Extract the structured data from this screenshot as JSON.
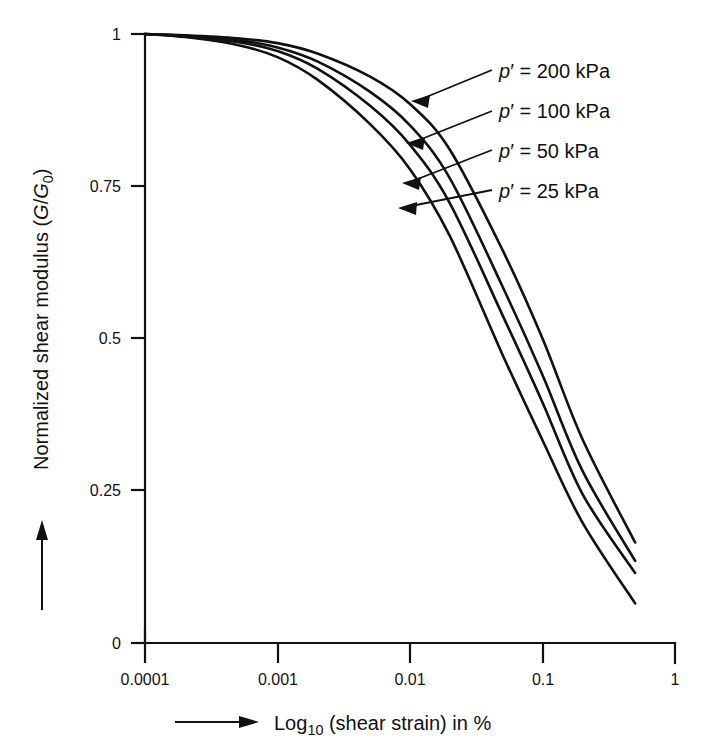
{
  "chart_data": {
    "type": "line",
    "title": "",
    "xlabel": "Log10 (shear strain) in %",
    "ylabel": "Normalized shear modulus (G/G0)",
    "xscale": "log",
    "xlim": [
      0.0001,
      1
    ],
    "ylim": [
      0,
      1
    ],
    "grid": false,
    "legend_position": "in-plot-right-with-arrows",
    "x_tick_labels": [
      "0.0001",
      "0.001",
      "0.01",
      "0.1",
      "1"
    ],
    "x_tick_values": [
      0.0001,
      0.001,
      0.01,
      0.1,
      1
    ],
    "y_tick_labels": [
      "0",
      "0.25",
      "0.5",
      "0.75",
      "1"
    ],
    "y_tick_values": [
      0,
      0.25,
      0.5,
      0.75,
      1
    ],
    "x": [
      0.0001,
      0.0002,
      0.0005,
      0.001,
      0.002,
      0.005,
      0.01,
      0.02,
      0.05,
      0.1,
      0.2,
      0.5
    ],
    "series": [
      {
        "name": "p' = 200 kPa",
        "pressure_kpa": 200,
        "values": [
          1.0,
          0.998,
          0.993,
          0.985,
          0.968,
          0.93,
          0.885,
          0.81,
          0.645,
          0.5,
          0.335,
          0.165
        ]
      },
      {
        "name": "p' = 100 kPa",
        "pressure_kpa": 100,
        "values": [
          1.0,
          0.997,
          0.99,
          0.978,
          0.955,
          0.905,
          0.85,
          0.763,
          0.585,
          0.44,
          0.283,
          0.135
        ]
      },
      {
        "name": "p' = 50 kPa",
        "pressure_kpa": 50,
        "values": [
          1.0,
          0.996,
          0.987,
          0.972,
          0.943,
          0.882,
          0.818,
          0.722,
          0.538,
          0.395,
          0.245,
          0.115
        ]
      },
      {
        "name": "p' = 25 kPa",
        "pressure_kpa": 25,
        "values": [
          1.0,
          0.995,
          0.982,
          0.962,
          0.925,
          0.852,
          0.778,
          0.668,
          0.473,
          0.333,
          0.198,
          0.065
        ]
      }
    ]
  },
  "axes": {
    "y_title_prefix": "Normalized shear modulus (",
    "y_title_symbol_g": "G",
    "y_title_slash": "/",
    "y_title_symbol_g0": "G",
    "y_title_sub0": "0",
    "y_title_suffix": ")",
    "x_title_log": "Log",
    "x_title_sub10": "10",
    "x_title_rest": " (shear strain) in %"
  },
  "annotations": {
    "labels": [
      {
        "p": "p",
        "prime": "′",
        "eq": " = ",
        "value": "200 kPa",
        "full": "p′ = 200 kPa"
      },
      {
        "p": "p",
        "prime": "′",
        "eq": " = ",
        "value": "100 kPa",
        "full": "p′ = 100 kPa"
      },
      {
        "p": "p",
        "prime": "′",
        "eq": " = ",
        "value": "50 kPa",
        "full": "p′ = 50 kPa"
      },
      {
        "p": "p",
        "prime": "′",
        "eq": " = ",
        "value": "25 kPa",
        "full": "p′ = 25 kPa"
      }
    ]
  },
  "colors": {
    "ink": "#111111",
    "background": "#ffffff"
  }
}
